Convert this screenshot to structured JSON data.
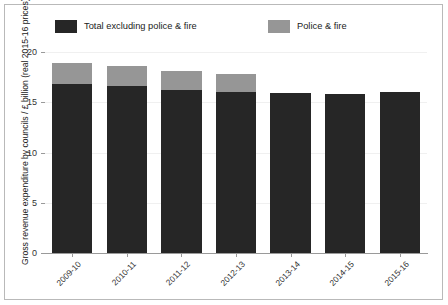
{
  "chart_data": {
    "type": "bar",
    "stacked": true,
    "title": "",
    "subtitle": "",
    "xlabel": "",
    "ylabel": "Gross revenue expenditure by councils / £ billion (real 2015-16 prices)",
    "categories": [
      "2009-10",
      "2010-11",
      "2011-12",
      "2012-13",
      "2013-14",
      "2014-15",
      "2015-16"
    ],
    "series": [
      {
        "name": "Total excluding police & fire",
        "color": "#262626",
        "values": [
          16.8,
          16.6,
          16.2,
          16.0,
          15.9,
          15.8,
          16.0
        ]
      },
      {
        "name": "Police & fire",
        "color": "#969696",
        "values": [
          2.1,
          2.0,
          1.9,
          1.8,
          0,
          0,
          0
        ]
      }
    ],
    "totals": [
      18.9,
      18.6,
      18.1,
      17.8,
      15.9,
      15.8,
      16.0
    ],
    "ylim": [
      0,
      20
    ],
    "yticks": [
      0,
      5,
      10,
      15,
      20
    ],
    "ytick_labels": [
      "0",
      "5",
      "10",
      "15",
      "20"
    ],
    "grid": true,
    "legend_position": "top"
  },
  "legend": {
    "entries": [
      {
        "label": "Total excluding police & fire",
        "color": "#262626"
      },
      {
        "label": "Police & fire",
        "color": "#969696"
      }
    ]
  },
  "colors": {
    "bar_dark": "#262626",
    "bar_light": "#969696",
    "axis": "#9a9a9a",
    "grid": "#f0f0f0",
    "frame": "#b9b9b9",
    "text": "#222222",
    "background": "#ffffff"
  }
}
